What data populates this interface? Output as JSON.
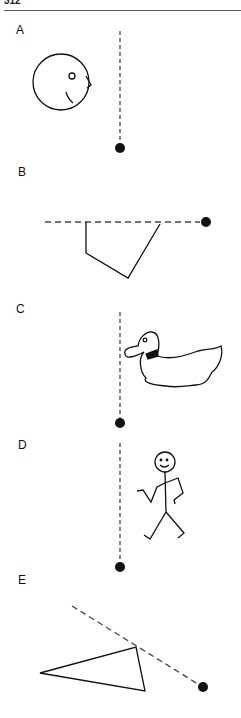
{
  "header": {
    "page_number": "312"
  },
  "panels": [
    {
      "label": "A",
      "subject": "circle-face-with-beak",
      "pivot": "dot-bottom",
      "plumb_line": "vertical-dashed"
    },
    {
      "label": "B",
      "subject": "open-quadrilateral-shape",
      "pivot": "dot-right",
      "plumb_line": "horizontal-dashed"
    },
    {
      "label": "C",
      "subject": "duck",
      "pivot": "dot-bottom",
      "plumb_line": "vertical-dashed"
    },
    {
      "label": "D",
      "subject": "stick-figure-walking",
      "pivot": "dot-bottom",
      "plumb_line": "vertical-dashed"
    },
    {
      "label": "E",
      "subject": "triangle",
      "pivot": "dot-lower-right",
      "plumb_line": "diagonal-dashed"
    }
  ],
  "colors": {
    "ink": "#111111",
    "dash": "#444444",
    "background": "#ffffff"
  }
}
